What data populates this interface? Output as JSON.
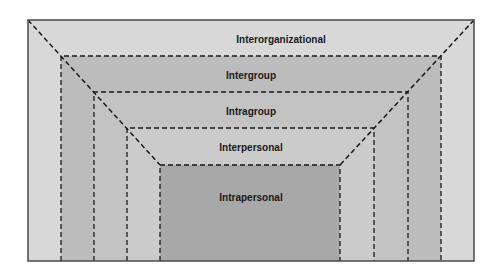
{
  "diagram": {
    "type": "nested-levels",
    "levels": [
      {
        "id": "interorganizational",
        "label": "Interorganizational",
        "color": "#d8d8d8"
      },
      {
        "id": "intergroup",
        "label": "Intergroup",
        "color": "#bcbcbc"
      },
      {
        "id": "intragroup",
        "label": "Intragroup",
        "color": "#c3c3c3"
      },
      {
        "id": "interpersonal",
        "label": "Interpersonal",
        "color": "#cbcbcb"
      },
      {
        "id": "intrapersonal",
        "label": "Intrapersonal",
        "color": "#a8a8a8"
      }
    ],
    "frame_color": "#4a4a4a",
    "line_color": "#1a1a1a"
  }
}
